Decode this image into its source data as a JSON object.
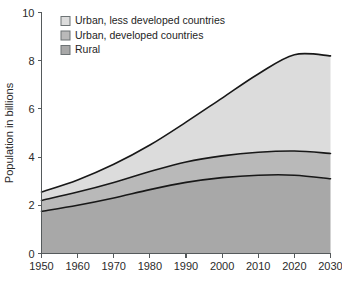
{
  "chart_data": {
    "type": "area",
    "title": "",
    "subtitle": "",
    "xlabel": "",
    "ylabel": "Population in billions",
    "xlim": [
      1950,
      2030
    ],
    "ylim": [
      0,
      10
    ],
    "grid": false,
    "stacked": true,
    "legend_position": "top-left",
    "x": [
      1950,
      1960,
      1970,
      1980,
      1990,
      2000,
      2010,
      2020,
      2030
    ],
    "xticklabels": [
      "1950",
      "1960",
      "1970",
      "1980",
      "1990",
      "2000",
      "2010",
      "2020",
      "2030"
    ],
    "yticks": [
      0,
      2,
      4,
      6,
      8,
      10
    ],
    "yticklabels": [
      "0",
      "2",
      "4",
      "6",
      "8",
      "10"
    ],
    "series": [
      {
        "name": "Rural",
        "color": "#a8a8a8",
        "values": [
          1.75,
          2.0,
          2.3,
          2.65,
          2.95,
          3.15,
          3.25,
          3.25,
          3.1
        ]
      },
      {
        "name": "Urban, developed countries",
        "color": "#b9b9b9",
        "values": [
          0.45,
          0.55,
          0.65,
          0.75,
          0.85,
          0.9,
          0.95,
          1.0,
          1.05
        ]
      },
      {
        "name": "Urban, less developed countries",
        "color": "#dcdcdc",
        "values": [
          0.35,
          0.5,
          0.75,
          1.1,
          1.65,
          2.4,
          3.25,
          4.0,
          4.05
        ]
      }
    ],
    "cumulative_totals": {
      "rural": [
        1.75,
        2.0,
        2.3,
        2.65,
        2.95,
        3.15,
        3.25,
        3.25,
        3.1
      ],
      "rural_plus_urban_developed": [
        2.2,
        2.55,
        2.95,
        3.4,
        3.8,
        4.05,
        4.2,
        4.25,
        4.15
      ],
      "total": [
        2.55,
        3.05,
        3.7,
        4.5,
        5.45,
        6.45,
        7.45,
        8.25,
        8.2
      ]
    }
  },
  "legend": {
    "items": [
      {
        "label": "Urban, less developed countries",
        "color": "#dcdcdc"
      },
      {
        "label": "Urban, developed countries",
        "color": "#b9b9b9"
      },
      {
        "label": "Rural",
        "color": "#a8a8a8"
      }
    ]
  },
  "axes": {
    "y_title": "Population in billions"
  }
}
